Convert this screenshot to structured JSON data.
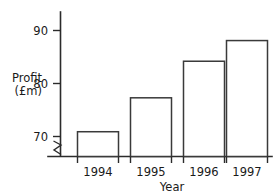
{
  "chart_data": {
    "type": "bar",
    "title": "",
    "subtitle": "",
    "xlabel": "Year",
    "ylabel": "Profit (£m)",
    "ylabel_line1": "Profit",
    "ylabel_line2": "(£m)",
    "categories": [
      "1994",
      "1995",
      "1996",
      "1997"
    ],
    "values": [
      70.9,
      77.3,
      84.2,
      88.1
    ],
    "series": [
      {
        "name": "Profit",
        "values": [
          70.9,
          77.3,
          84.2,
          88.1
        ]
      }
    ],
    "ytick_labels": [
      "70",
      "80",
      "90"
    ],
    "yticks": [
      70,
      80,
      90
    ],
    "ylim": [
      67.8,
      91.9
    ],
    "axis_break": true,
    "axis_break_note": "zigzag break on y-axis below 70",
    "grid": false,
    "legend": false,
    "legend_position": "none",
    "bar_fill": "#ffffff",
    "bar_stroke": "#3a3a3a",
    "axis_color": "#2b2b2b",
    "background": "#ffffff"
  },
  "labels": {
    "y_tick_90": "90",
    "y_tick_80": "80",
    "y_tick_70": "70",
    "cat_0": "1994",
    "cat_1": "1995",
    "cat_2": "1996",
    "cat_3": "1997",
    "x_axis_title": "Year",
    "y_axis_title_line1": "Profit",
    "y_axis_title_line2": "(£m)"
  }
}
